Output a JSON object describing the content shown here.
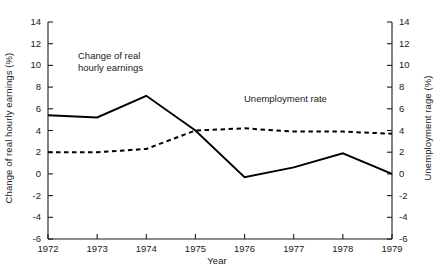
{
  "chart_data": {
    "type": "line",
    "title": "",
    "xlabel": "Year",
    "ylabel": "Change of real hourly earnings (%)",
    "ylabel_right": "Unemployment rage (%)",
    "categories": [
      "1972",
      "1973",
      "1974",
      "1975",
      "1976",
      "1977",
      "1978",
      "1979"
    ],
    "x": [
      1972,
      1973,
      1974,
      1975,
      1976,
      1977,
      1978,
      1979
    ],
    "xlim": [
      1972,
      1979
    ],
    "ylim": [
      -6,
      14
    ],
    "ylim_right": [
      -6,
      14
    ],
    "ytick_labels": [
      "14",
      "12",
      "10",
      "8",
      "6",
      "4",
      "2",
      "0",
      "-2",
      "-4",
      "-6"
    ],
    "ytick_values": [
      14,
      12,
      10,
      8,
      6,
      4,
      2,
      0,
      -2,
      -4,
      -6
    ],
    "ytick_labels_right": [
      "14",
      "12",
      "10",
      "8",
      "6",
      "4",
      "2",
      "0",
      "-2",
      "-4",
      "-6"
    ],
    "grid": false,
    "legend_position": "inline-annotations",
    "series": [
      {
        "name": "Change of real hourly earnings",
        "style": "solid",
        "axis": "left",
        "color": "#000000",
        "values": [
          5.4,
          5.2,
          7.2,
          4.0,
          -0.3,
          0.6,
          1.9,
          0.0
        ]
      },
      {
        "name": "Unemployment rate",
        "style": "dashed",
        "axis": "right",
        "color": "#000000",
        "values": [
          2.0,
          2.0,
          2.3,
          4.0,
          4.2,
          3.9,
          3.9,
          3.7
        ]
      }
    ],
    "annotations": [
      {
        "id": "earnings",
        "text": "Change of real\nhourly earnings"
      },
      {
        "id": "unemployment",
        "text": "Unemployment rate"
      }
    ]
  }
}
